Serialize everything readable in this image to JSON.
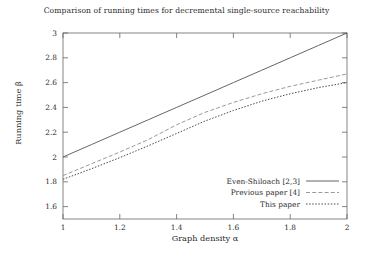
{
  "chart_data": {
    "type": "line",
    "title": "Comparison of running times for decremental single-source reachability",
    "xlabel": "Graph density α",
    "ylabel": "Running time β",
    "xlim": [
      1,
      2
    ],
    "ylim": [
      1.5,
      3
    ],
    "grid": false,
    "legend_position": "bottom-right",
    "xticks": [
      "1",
      "1.2",
      "1.4",
      "1.6",
      "1.8",
      "2"
    ],
    "xtick_values": [
      1,
      1.2,
      1.4,
      1.6,
      1.8,
      2
    ],
    "yticks": [
      "1.6",
      "1.8",
      "2",
      "2.2",
      "2.4",
      "2.6",
      "2.8",
      "3"
    ],
    "ytick_values": [
      1.6,
      1.8,
      2,
      2.2,
      2.4,
      2.6,
      2.8,
      3
    ],
    "x": [
      1,
      1.1,
      1.2,
      1.3,
      1.4,
      1.5,
      1.6,
      1.7,
      1.8,
      1.9,
      2
    ],
    "series": [
      {
        "name": "Even-Shiloach [2,3]",
        "style": "solid",
        "color": "#555555",
        "values": [
          2.0,
          2.1,
          2.2,
          2.3,
          2.4,
          2.5,
          2.6,
          2.7,
          2.8,
          2.9,
          3.0
        ]
      },
      {
        "name": "Previous paper [4]",
        "style": "dashed",
        "color": "#9a9a9a",
        "values": [
          1.85,
          1.945,
          2.04,
          2.14,
          2.26,
          2.36,
          2.44,
          2.51,
          2.57,
          2.62,
          2.67
        ]
      },
      {
        "name": "This paper",
        "style": "dotted",
        "color": "#4a4a4a",
        "values": [
          1.82,
          1.905,
          1.995,
          2.09,
          2.19,
          2.29,
          2.375,
          2.45,
          2.51,
          2.56,
          2.6
        ]
      }
    ]
  },
  "legend": {
    "items": [
      {
        "label": "Even-Shiloach [2,3]"
      },
      {
        "label": "Previous paper [4]"
      },
      {
        "label": "This paper"
      }
    ]
  }
}
